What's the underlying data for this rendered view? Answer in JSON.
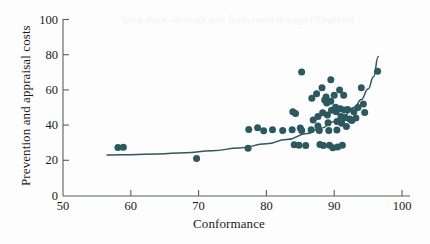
{
  "chart_data": {
    "type": "scatter",
    "title": "",
    "xlabel": "Conformance",
    "ylabel": "Prevention and appraisal costs",
    "xlim": [
      50,
      100
    ],
    "ylim": [
      0,
      100
    ],
    "xticks": [
      50,
      60,
      70,
      80,
      90,
      100
    ],
    "yticks": [
      0,
      20,
      40,
      60,
      80,
      100
    ],
    "grid": false,
    "legend": null,
    "marker_color": "#2c5860",
    "trend_color": "#2c5860",
    "trend_line": {
      "type": "exponential-fit",
      "description": "Upward-curving fitted trend line rising from about 23 at conformance 56.5 to about 79 at conformance 96.5",
      "points": [
        {
          "x": 56.5,
          "y": 23.0
        },
        {
          "x": 60.0,
          "y": 23.2
        },
        {
          "x": 64.0,
          "y": 23.6
        },
        {
          "x": 68.0,
          "y": 24.3
        },
        {
          "x": 72.0,
          "y": 25.4
        },
        {
          "x": 76.0,
          "y": 27.0
        },
        {
          "x": 80.0,
          "y": 29.4
        },
        {
          "x": 83.0,
          "y": 31.8
        },
        {
          "x": 86.0,
          "y": 35.2
        },
        {
          "x": 88.0,
          "y": 38.2
        },
        {
          "x": 90.0,
          "y": 42.0
        },
        {
          "x": 91.5,
          "y": 45.6
        },
        {
          "x": 93.0,
          "y": 50.2
        },
        {
          "x": 94.0,
          "y": 54.5
        },
        {
          "x": 95.0,
          "y": 60.5
        },
        {
          "x": 95.8,
          "y": 67.5
        },
        {
          "x": 96.5,
          "y": 79.0
        }
      ]
    },
    "points": [
      {
        "x": 58.1,
        "y": 27.3
      },
      {
        "x": 58.9,
        "y": 27.4
      },
      {
        "x": 69.7,
        "y": 21.0
      },
      {
        "x": 77.3,
        "y": 26.8
      },
      {
        "x": 77.4,
        "y": 37.5
      },
      {
        "x": 78.7,
        "y": 38.5
      },
      {
        "x": 79.6,
        "y": 36.8
      },
      {
        "x": 80.9,
        "y": 37.4
      },
      {
        "x": 82.4,
        "y": 36.9
      },
      {
        "x": 83.8,
        "y": 37.4
      },
      {
        "x": 83.9,
        "y": 47.6
      },
      {
        "x": 84.3,
        "y": 46.6
      },
      {
        "x": 84.1,
        "y": 28.8
      },
      {
        "x": 85.0,
        "y": 38.4
      },
      {
        "x": 85.2,
        "y": 36.9
      },
      {
        "x": 85.2,
        "y": 70.2
      },
      {
        "x": 84.8,
        "y": 28.6
      },
      {
        "x": 85.8,
        "y": 28.4
      },
      {
        "x": 86.6,
        "y": 37.3
      },
      {
        "x": 86.9,
        "y": 42.9
      },
      {
        "x": 86.7,
        "y": 55.3
      },
      {
        "x": 87.4,
        "y": 57.8
      },
      {
        "x": 87.6,
        "y": 44.9
      },
      {
        "x": 87.6,
        "y": 39.5
      },
      {
        "x": 87.8,
        "y": 37.0
      },
      {
        "x": 87.9,
        "y": 29.0
      },
      {
        "x": 88.2,
        "y": 61.2
      },
      {
        "x": 88.3,
        "y": 47.0
      },
      {
        "x": 88.4,
        "y": 28.4
      },
      {
        "x": 88.6,
        "y": 54.2
      },
      {
        "x": 88.8,
        "y": 56.0
      },
      {
        "x": 88.9,
        "y": 52.6
      },
      {
        "x": 89.0,
        "y": 45.8
      },
      {
        "x": 89.1,
        "y": 41.3
      },
      {
        "x": 89.2,
        "y": 36.9
      },
      {
        "x": 89.3,
        "y": 28.6
      },
      {
        "x": 89.5,
        "y": 65.8
      },
      {
        "x": 89.5,
        "y": 53.6
      },
      {
        "x": 89.6,
        "y": 48.5
      },
      {
        "x": 89.8,
        "y": 27.2
      },
      {
        "x": 90.0,
        "y": 56.9
      },
      {
        "x": 90.2,
        "y": 50.1
      },
      {
        "x": 90.3,
        "y": 47.6
      },
      {
        "x": 90.4,
        "y": 42.0
      },
      {
        "x": 90.4,
        "y": 37.2
      },
      {
        "x": 90.5,
        "y": 27.6
      },
      {
        "x": 90.8,
        "y": 60.0
      },
      {
        "x": 90.9,
        "y": 49.3
      },
      {
        "x": 91.0,
        "y": 44.9
      },
      {
        "x": 91.1,
        "y": 41.0
      },
      {
        "x": 91.2,
        "y": 28.6
      },
      {
        "x": 91.4,
        "y": 57.0
      },
      {
        "x": 91.5,
        "y": 48.6
      },
      {
        "x": 91.6,
        "y": 44.2
      },
      {
        "x": 91.8,
        "y": 39.2
      },
      {
        "x": 92.0,
        "y": 48.8
      },
      {
        "x": 92.3,
        "y": 43.4
      },
      {
        "x": 92.6,
        "y": 42.6
      },
      {
        "x": 92.9,
        "y": 47.6
      },
      {
        "x": 93.2,
        "y": 44.0
      },
      {
        "x": 93.5,
        "y": 50.0
      },
      {
        "x": 94.0,
        "y": 61.2
      },
      {
        "x": 94.3,
        "y": 52.0
      },
      {
        "x": 94.5,
        "y": 47.2
      },
      {
        "x": 96.4,
        "y": 70.6
      }
    ]
  },
  "axes": {
    "y_title": "Prevention and appraisal costs",
    "x_title": "Conformance",
    "y_tick_labels": [
      "100",
      "80",
      "60",
      "40",
      "20",
      "0"
    ],
    "x_tick_labels": [
      "50",
      "60",
      "70",
      "80",
      "90",
      "100"
    ]
  },
  "artifacts": {
    "bleed_through_top": "faint show-through text from reverse page (illegible)"
  }
}
